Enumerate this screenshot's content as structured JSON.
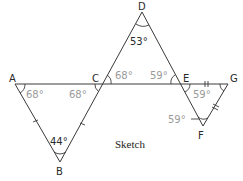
{
  "diagram": {
    "caption": "Sketch",
    "points": {
      "A": {
        "label": "A",
        "x": 15,
        "y": 84
      },
      "B": {
        "label": "B",
        "x": 60,
        "y": 162
      },
      "C": {
        "label": "C",
        "x": 102,
        "y": 83
      },
      "D": {
        "label": "D",
        "x": 142,
        "y": 12
      },
      "E": {
        "label": "E",
        "x": 180,
        "y": 83
      },
      "F": {
        "label": "F",
        "x": 203,
        "y": 126
      },
      "G": {
        "label": "G",
        "x": 228,
        "y": 84
      }
    },
    "angles": {
      "A": "68°",
      "C_in_ABC": "68°",
      "B": "44°",
      "D": "53°",
      "C_in_CDE": "68°",
      "E_in_CDE": "59°",
      "E_in_EFG": "59°",
      "F": "59°"
    },
    "colors": {
      "line": "#3a3a3a",
      "given_angle_text": "#2a2a2a",
      "derived_angle_text": "#9a9a9a"
    }
  }
}
